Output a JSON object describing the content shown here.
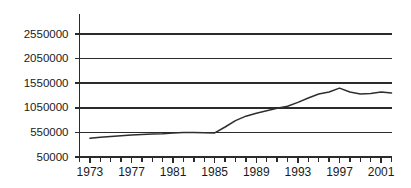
{
  "chart_data": {
    "type": "line",
    "title": "",
    "subtitle": "",
    "xlabel": "",
    "ylabel": "",
    "grid": true,
    "legend": false,
    "xlim": [
      1972,
      2002
    ],
    "ylim": [
      50000,
      2800000
    ],
    "yticks": [
      50000,
      550000,
      1050000,
      1550000,
      2050000,
      2550000
    ],
    "ytick_labels": [
      "50000",
      "550000",
      "1050000",
      "1550000",
      "2050000",
      "2550000"
    ],
    "xticks": [
      1973,
      1977,
      1981,
      1985,
      1989,
      1993,
      1997,
      2001
    ],
    "xtick_labels": [
      "1973",
      "1977",
      "1981",
      "1985",
      "1989",
      "1993",
      "1997",
      "2001"
    ],
    "xminor_step": 1,
    "series": [
      {
        "name": "series-1",
        "color": "#2e2e2e",
        "x": [
          1973,
          1974,
          1975,
          1976,
          1977,
          1978,
          1979,
          1980,
          1981,
          1982,
          1983,
          1984,
          1985,
          1986,
          1987,
          1988,
          1989,
          1990,
          1991,
          1992,
          1993,
          1994,
          1995,
          1996,
          1997,
          1998,
          1999,
          2000,
          2001,
          2002
        ],
        "values": [
          430000,
          450000,
          465000,
          480000,
          495000,
          505000,
          515000,
          525000,
          540000,
          550000,
          550000,
          545000,
          540000,
          660000,
          790000,
          880000,
          940000,
          990000,
          1040000,
          1080000,
          1160000,
          1250000,
          1330000,
          1370000,
          1450000,
          1370000,
          1330000,
          1340000,
          1370000,
          1350000
        ]
      }
    ]
  },
  "axes": {
    "y_axis_name": "value-axis",
    "x_axis_name": "year-axis"
  }
}
